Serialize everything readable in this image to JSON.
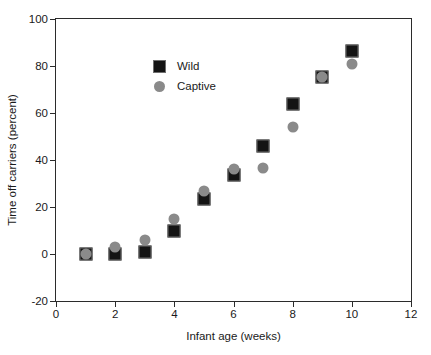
{
  "chart_data": {
    "type": "scatter",
    "title": "",
    "xlabel": "Infant age (weeks)",
    "ylabel": "Time off carriers (percent)",
    "xlim": [
      0,
      12
    ],
    "ylim": [
      -20,
      100
    ],
    "xticks": [
      0,
      2,
      4,
      6,
      8,
      10,
      12
    ],
    "yticks": [
      -20,
      0,
      20,
      40,
      60,
      80,
      100
    ],
    "xtick_labels": [
      "0",
      "2",
      "4",
      "6",
      "8",
      "10",
      "12"
    ],
    "ytick_labels": [
      "-20",
      "0",
      "20",
      "40",
      "60",
      "80",
      "100"
    ],
    "grid": false,
    "legend_position": "upper left",
    "x": [
      1,
      2,
      3,
      4,
      5,
      6,
      7,
      8,
      9,
      10
    ],
    "series": [
      {
        "name": "Wild",
        "marker": "square",
        "color": "#141414",
        "values": [
          0,
          0,
          1,
          10,
          23.5,
          33.5,
          46,
          64,
          75.5,
          86.5
        ]
      },
      {
        "name": "Captive",
        "marker": "circle",
        "color": "#8a8a8a",
        "values": [
          0,
          3,
          6,
          15,
          27,
          36,
          36.5,
          54,
          75.5,
          81
        ]
      }
    ]
  },
  "legend": {
    "items": [
      {
        "label": "Wild",
        "marker": "square"
      },
      {
        "label": "Captive",
        "marker": "circle"
      }
    ]
  },
  "colors": {
    "wild": "#141414",
    "captive": "#8a8a8a",
    "axis": "#2b2b2b",
    "background": "#ffffff"
  }
}
